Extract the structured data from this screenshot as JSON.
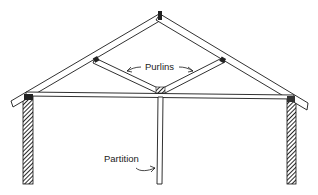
{
  "diagram": {
    "type": "roof truss cross-section",
    "labels": {
      "purlins": "Purlins",
      "partition": "Partition"
    },
    "colors": {
      "line": "#1a1a1a",
      "background": "#ffffff"
    }
  }
}
